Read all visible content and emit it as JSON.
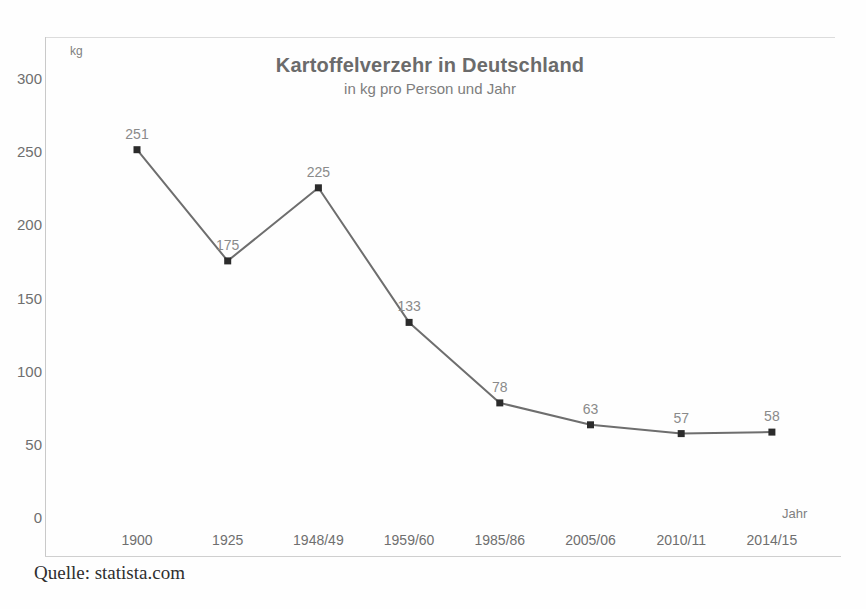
{
  "chart_data": {
    "type": "line",
    "title": "Kartoffelverzehr in Deutschland",
    "subtitle": "in kg pro Person und Jahr",
    "xlabel": "Jahr",
    "ylabel": "kg",
    "categories": [
      "1900",
      "1925",
      "1948/49",
      "1959/60",
      "1985/86",
      "2005/06",
      "2010/11",
      "2014/15"
    ],
    "values": [
      251,
      175,
      225,
      133,
      78,
      63,
      57,
      58
    ],
    "point_labels": [
      "251",
      "175",
      "225",
      "133",
      "78",
      "63",
      "57",
      "58"
    ],
    "ylim": [
      0,
      300
    ],
    "yticks": [
      0,
      50,
      100,
      150,
      200,
      250,
      300
    ],
    "ytick_labels": [
      "0",
      "50",
      "100",
      "150",
      "200",
      "250",
      "300"
    ],
    "grid": false,
    "legend": false,
    "line_color": "#6e6e6e",
    "marker_color": "#2b2b2b",
    "marker_shape": "square"
  },
  "caption": {
    "source": "Quelle: statista.com"
  }
}
